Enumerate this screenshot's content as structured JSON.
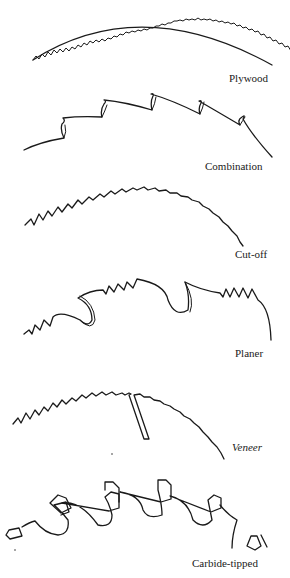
{
  "figure": {
    "blades": [
      {
        "id": "plywood",
        "label": "Plywood"
      },
      {
        "id": "combination",
        "label": "Combination"
      },
      {
        "id": "cut-off",
        "label": "Cut-off"
      },
      {
        "id": "planer",
        "label": "Planer"
      },
      {
        "id": "veneer",
        "label": "Veneer"
      },
      {
        "id": "carbide-tipped",
        "label": "Carbide-tipped"
      }
    ]
  },
  "colors": {
    "ink": "#1a1a1a",
    "background": "#ffffff"
  }
}
